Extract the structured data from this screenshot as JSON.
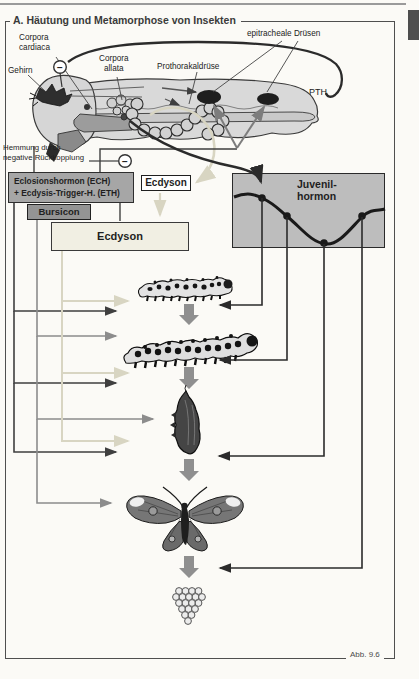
{
  "page": {
    "title": "A. Häutung und Metamorphose von Insekten",
    "caption": "Abb. 9.6",
    "minus_symbol": "−"
  },
  "anatomy": {
    "gehirn": "Gehirn",
    "corpora_cardiaca_line1": "Corpora",
    "corpora_cardiaca_line2": "cardiaca",
    "corpora_allata_line1": "Corpora",
    "corpora_allata_line2": "allata",
    "prothorakaldruese": "Prothorakaldrüse",
    "epitracheale_druesen": "epitracheale Drüsen",
    "ech": "ECH",
    "ptth": "PTTH",
    "eth_pth": "ETH, PTH"
  },
  "feedback": {
    "line1": "Hemmung durch",
    "line2": "negative Rückkopplung"
  },
  "boxes": {
    "eclosion_line1": "Eclosionshormon (ECH)",
    "eclosion_line2": "+ Ecdysis-Trigger-H. (ETH)",
    "bursicon": "Bursicon",
    "ecdyson_small": "Ecdyson",
    "ecdyson_large": "Ecdyson",
    "juvenil_line1": "Juvenil-",
    "juvenil_line2": "hormon"
  },
  "icons": {
    "stages": [
      "larva-small-icon",
      "larva-large-icon",
      "pupa-icon",
      "butterfly-icon",
      "egg-cluster-icon"
    ],
    "minus_circles": [
      "negative-feedback-minus-icon-brain",
      "negative-feedback-minus-icon-pathway"
    ]
  },
  "juvenilhormon_profile": {
    "type": "line",
    "points_px": [
      [
        262,
        198
      ],
      [
        287,
        216
      ],
      [
        324,
        243
      ],
      [
        362,
        216
      ]
    ],
    "shape": "high at larval stages, minimum at pupation, rising again in adult"
  },
  "colors": {
    "page_bg": "#fbfaf6",
    "frame": "#4f4f4f",
    "box_eclosion": "#a6a6a6",
    "box_bursicon": "#949494",
    "box_ecdyson_small": "#ffffff",
    "box_ecdyson_large": "#f1efe3",
    "box_juvenil": "#bdbdbd",
    "arrow_dark": "#3f3f3f",
    "arrow_medium": "#8c8c8c",
    "arrow_pale": "#d8d5c2",
    "arrow_black": "#2b2b2b",
    "stage_arrow": "#8f8f8f",
    "body_fill": "#d9d9d9",
    "gland_dark": "#1e1e1e"
  }
}
